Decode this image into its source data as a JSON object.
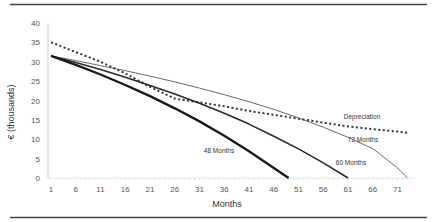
{
  "chart_data": {
    "type": "line",
    "title": "",
    "xlabel": "Months",
    "ylabel": "€ (thousands)",
    "xlim": [
      1,
      73
    ],
    "ylim": [
      0,
      40
    ],
    "x_ticks": [
      "1",
      "6",
      "11",
      "16",
      "21",
      "26",
      "31",
      "36",
      "41",
      "46",
      "51",
      "56",
      "61",
      "66",
      "71"
    ],
    "y_ticks": [
      "0",
      "5",
      "10",
      "15",
      "20",
      "25",
      "30",
      "35",
      "40"
    ],
    "grid": false,
    "legend": "inline labels",
    "series": [
      {
        "name": "Depreciation",
        "style": "dotted",
        "x": [
          1,
          6,
          11,
          16,
          21,
          26,
          31,
          36,
          41,
          46,
          51,
          56,
          61,
          66,
          71,
          73
        ],
        "values": [
          35.0,
          32.5,
          30.0,
          27.0,
          23.5,
          20.5,
          19.5,
          18.5,
          17.3,
          16.3,
          15.3,
          14.3,
          13.3,
          12.6,
          12.0,
          11.7
        ]
      },
      {
        "name": "72 Months",
        "style": "thin",
        "x": [
          1,
          6,
          11,
          16,
          21,
          26,
          31,
          36,
          41,
          46,
          51,
          56,
          61,
          66,
          71,
          73
        ],
        "values": [
          31.5,
          30.3,
          29.0,
          27.7,
          26.3,
          24.8,
          23.2,
          21.5,
          19.7,
          17.7,
          15.5,
          13.1,
          10.5,
          7.6,
          2.6,
          0
        ]
      },
      {
        "name": "60 Months",
        "style": "medium",
        "x": [
          1,
          6,
          11,
          16,
          21,
          26,
          31,
          36,
          41,
          46,
          51,
          56,
          61
        ],
        "values": [
          31.5,
          29.8,
          28.0,
          26.0,
          23.9,
          21.7,
          19.3,
          16.7,
          13.9,
          10.8,
          7.5,
          3.9,
          0
        ]
      },
      {
        "name": "48 Months",
        "style": "thick",
        "x": [
          1,
          6,
          11,
          16,
          21,
          26,
          31,
          36,
          41,
          46,
          49
        ],
        "values": [
          31.5,
          29.2,
          26.7,
          24.0,
          21.1,
          18.0,
          14.6,
          10.9,
          6.9,
          2.6,
          0
        ]
      }
    ],
    "annotations": [
      {
        "text": "Depreciation",
        "x": 60,
        "y": 17
      },
      {
        "text": "72 Months",
        "x": 62,
        "y": 12.5
      },
      {
        "text": "60 Months",
        "x": 61,
        "y": 6
      },
      {
        "text": "48 Months",
        "x": 37,
        "y": 7
      }
    ]
  },
  "labels": {
    "y_axis_title": "€ (thousands)",
    "x_axis_title": "Months",
    "series_depreciation": "Depreciation",
    "series_72": "72 Months",
    "series_60": "60 Months",
    "series_48": "48 Months"
  }
}
